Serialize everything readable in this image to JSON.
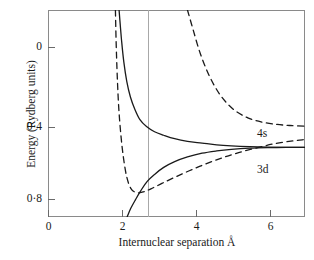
{
  "figure": {
    "background_color": "#ffffff",
    "frame_color": "#8a8a8a",
    "curve_color": "#1a1a1a",
    "guide_line_color": "#a8a8a8"
  },
  "axes": {
    "y_title": "Energy   (Rydberg units)",
    "x_title": "Internuclear separation   Å",
    "y_ticks": [
      {
        "label": "0",
        "value": 0
      },
      {
        "label": "0·4",
        "value": 0.4
      },
      {
        "label": "0·8",
        "value": 0.8
      }
    ],
    "x_ticks": [
      {
        "label": "0",
        "value": 0
      },
      {
        "label": "2",
        "value": 2
      },
      {
        "label": "4",
        "value": 4
      },
      {
        "label": "6",
        "value": 6
      }
    ]
  },
  "annotations": {
    "curve_label_4s": "4s",
    "curve_label_3d": "3d"
  },
  "chart_data": {
    "type": "line",
    "title": "",
    "xlabel": "Internuclear separation   Å",
    "ylabel": "Energy   (Rydberg units)",
    "xlim": [
      0,
      7
    ],
    "ylim": [
      0.95,
      -0.24
    ],
    "y_axis_inverted": true,
    "grid": false,
    "legend": "inline-labels",
    "xticks": [
      0,
      2,
      4,
      6
    ],
    "yticks": [
      0,
      0.4,
      0.8
    ],
    "guide_lines": [
      {
        "type": "vertical",
        "x": 2.7,
        "style": "thin-solid-gray"
      }
    ],
    "series": [
      {
        "name": "4s upper (solid, repulsive)",
        "style": "solid",
        "label": "",
        "x": [
          1.93,
          1.96,
          2.0,
          2.06,
          2.14,
          2.24,
          2.36,
          2.5,
          2.68,
          2.9,
          3.15,
          3.45,
          3.8,
          4.2,
          4.6,
          5.0,
          5.5,
          6.0,
          6.5,
          7.0
        ],
        "y": [
          -0.24,
          -0.16,
          -0.06,
          0.06,
          0.17,
          0.26,
          0.33,
          0.39,
          0.43,
          0.46,
          0.48,
          0.5,
          0.515,
          0.525,
          0.535,
          0.541,
          0.546,
          0.549,
          0.55,
          0.55
        ]
      },
      {
        "name": "3d lower (solid, bound)",
        "style": "solid",
        "label": "3d",
        "x": [
          2.15,
          2.25,
          2.38,
          2.52,
          2.7,
          2.9,
          3.15,
          3.45,
          3.8,
          4.2,
          4.6,
          5.0,
          5.5,
          6.0,
          6.5,
          7.0
        ],
        "y": [
          0.95,
          0.9,
          0.85,
          0.8,
          0.745,
          0.705,
          0.665,
          0.632,
          0.605,
          0.583,
          0.57,
          0.561,
          0.554,
          0.551,
          0.55,
          0.55
        ]
      },
      {
        "name": "4s asymptote (dashed, upper right)",
        "style": "dashed",
        "label": "4s",
        "x": [
          3.8,
          3.95,
          4.15,
          4.4,
          4.7,
          5.05,
          5.45,
          5.85,
          6.25,
          6.6,
          7.0
        ],
        "y": [
          -0.24,
          -0.13,
          0.01,
          0.14,
          0.25,
          0.33,
          0.38,
          0.405,
          0.418,
          0.424,
          0.428
        ]
      },
      {
        "name": "3d dashed (left branch, bound minimum)",
        "style": "dashed",
        "label": "",
        "x": [
          1.83,
          1.85,
          1.88,
          1.92,
          1.98,
          2.05,
          2.14,
          2.25,
          2.4,
          2.58,
          2.8,
          3.1,
          3.45,
          3.85,
          4.3,
          4.75,
          5.2,
          5.7,
          6.2,
          6.7,
          7.0
        ],
        "y": [
          -0.24,
          -0.05,
          0.14,
          0.32,
          0.48,
          0.61,
          0.72,
          0.785,
          0.81,
          0.806,
          0.788,
          0.757,
          0.722,
          0.684,
          0.645,
          0.61,
          0.58,
          0.552,
          0.528,
          0.512,
          0.505
        ]
      }
    ]
  }
}
